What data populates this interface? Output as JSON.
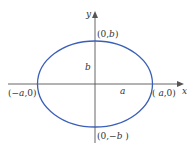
{
  "diagram": {
    "type": "ellipse-on-axes",
    "axes": {
      "x_label": "x",
      "y_label": "y",
      "axis_color": "#555555"
    },
    "ellipse": {
      "color": "#3a5fb8",
      "center": [
        95,
        84
      ],
      "rx": 57.5,
      "ry": 43
    },
    "labels": {
      "top_vertex": "(0,b)",
      "bottom_vertex": "(0,-b)",
      "left_vertex": "(-a,0)",
      "right_vertex": "(a,0)",
      "semi_minor": "b",
      "semi_major": "a"
    }
  }
}
